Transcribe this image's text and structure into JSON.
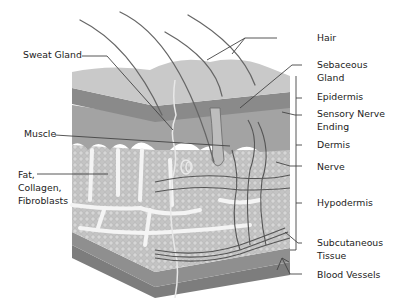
{
  "diagram": {
    "colors": {
      "background": "#ffffff",
      "epidermis_top": "#c9c9c9",
      "epidermis_dark": "#8a8a8a",
      "dermis": "#a3a3a3",
      "fat": "#c4c4c4",
      "fat_spaces": "#f2f2f2",
      "subcutaneous": "#7d7d7d",
      "lines": "#444444",
      "text": "#222222"
    },
    "labels_left": [
      {
        "id": "sweat-gland",
        "text": "Sweat Gland"
      },
      {
        "id": "muscle",
        "text": "Muscle"
      },
      {
        "id": "fat-collagen-fibroblasts",
        "text": "Fat,\nCollagen,\nFibroblasts"
      }
    ],
    "labels_right": [
      {
        "id": "hair",
        "text": "Hair"
      },
      {
        "id": "sebaceous-gland",
        "text": "Sebaceous\nGland"
      },
      {
        "id": "epidermis",
        "text": "Epidermis"
      },
      {
        "id": "sensory-nerve-ending",
        "text": "Sensory Nerve\nEnding"
      },
      {
        "id": "dermis",
        "text": "Dermis"
      },
      {
        "id": "nerve",
        "text": "Nerve"
      },
      {
        "id": "hypodermis",
        "text": "Hypodermis"
      },
      {
        "id": "subcutaneous-tissue",
        "text": "Subcutaneous\nTissue"
      },
      {
        "id": "blood-vessels",
        "text": "Blood Vessels"
      }
    ]
  }
}
